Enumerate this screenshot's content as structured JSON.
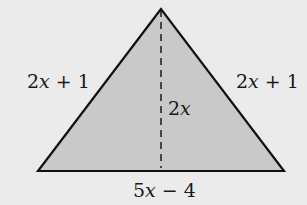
{
  "diagram": {
    "type": "isosceles-triangle",
    "colors": {
      "background": "#ebebeb",
      "fill": "#c9c9c9",
      "stroke": "#111111"
    },
    "labels": {
      "left_side": {
        "coef": "2",
        "var": "x",
        "rest": " + 1"
      },
      "right_side": {
        "coef": "2",
        "var": "x",
        "rest": " + 1"
      },
      "height": {
        "coef": "2",
        "var": "x",
        "rest": ""
      },
      "base": {
        "coef": "5",
        "var": "x",
        "rest": " − 4"
      }
    }
  }
}
